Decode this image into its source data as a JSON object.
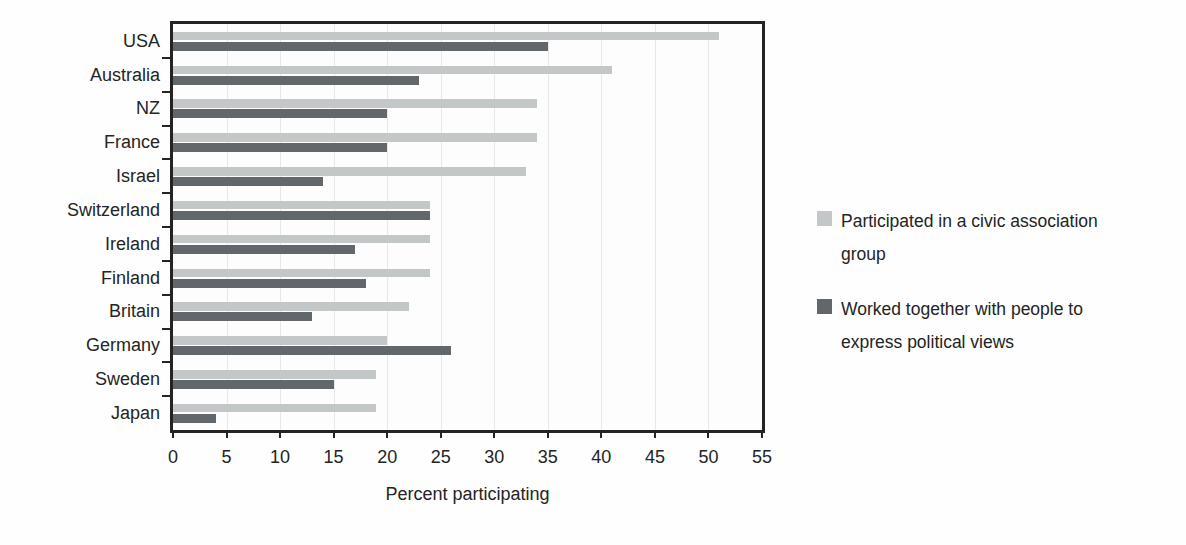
{
  "chart_data": {
    "type": "bar",
    "orientation": "horizontal",
    "title": "",
    "xlabel": "Percent participating",
    "ylabel": "",
    "xlim": [
      0,
      55
    ],
    "xticks": [
      0,
      5,
      10,
      15,
      20,
      25,
      30,
      35,
      40,
      45,
      50,
      55
    ],
    "grid": true,
    "legend_position": "right",
    "categories": [
      "USA",
      "Australia",
      "NZ",
      "France",
      "Israel",
      "Switzerland",
      "Ireland",
      "Finland",
      "Britain",
      "Germany",
      "Sweden",
      "Japan"
    ],
    "series": [
      {
        "name": "Participated in a civic association group",
        "color": "#c3c7c8",
        "values": [
          51,
          41,
          34,
          34,
          33,
          24,
          24,
          24,
          22,
          20,
          19,
          19
        ]
      },
      {
        "name": "Worked together with people to express political views",
        "color": "#61676b",
        "values": [
          35,
          23,
          20,
          20,
          14,
          24,
          17,
          18,
          13,
          26,
          15,
          4
        ]
      }
    ]
  },
  "legend": {
    "items": [
      {
        "line1": "Participated in a civic association",
        "line2": "group",
        "color": "#c3c7c8"
      },
      {
        "line1": "Worked together with people to",
        "line2": "express political views",
        "color": "#61676b"
      }
    ]
  },
  "colors": {
    "background": "#fefefe",
    "frame": "#242424",
    "gridline": "#e6e9e8",
    "text": "#242424",
    "series_civic": "#c3c7c8",
    "series_political": "#61676b"
  }
}
